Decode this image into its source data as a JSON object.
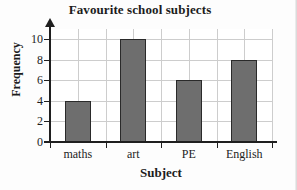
{
  "chart_data": {
    "type": "bar",
    "title": "Favourite school subjects",
    "xlabel": "Subject",
    "ylabel": "Frequency",
    "categories": [
      "maths",
      "art",
      "PE",
      "English"
    ],
    "values": [
      4,
      10,
      6,
      8
    ],
    "ylim": [
      0,
      11
    ],
    "ytick_labels": [
      "0",
      "2",
      "4",
      "6",
      "8",
      "10"
    ],
    "ytick_values": [
      0,
      2,
      4,
      6,
      8,
      10
    ],
    "grid": "both",
    "legend": "none",
    "bar_fill_color": "#6e6e6e",
    "bar_edge_color": "#2a2a2a",
    "gridline_color": "#cdcdcd",
    "axis_color": "#1f1f1f",
    "background_color": "#ffffff"
  }
}
